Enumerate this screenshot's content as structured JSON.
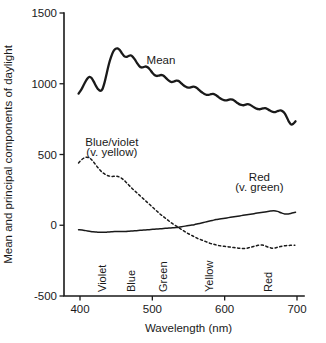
{
  "chart_data": {
    "type": "line",
    "title": "",
    "xlabel": "Wavelength (nm)",
    "ylabel": "Mean and principal components of daylight",
    "xlim": [
      390,
      702
    ],
    "ylim": [
      -500,
      1500
    ],
    "xticks": [
      400,
      500,
      600,
      700
    ],
    "xticklabels": [
      "400",
      "500",
      "600",
      "700"
    ],
    "yticks": [
      -500,
      0,
      500,
      1000,
      1500
    ],
    "yticklabels": [
      "-500",
      "0",
      "500",
      "1000",
      "1500"
    ],
    "grid": false,
    "legend_position": "inline-annotations",
    "band_labels": [
      {
        "text": "Violet",
        "wavelength": 430
      },
      {
        "text": "Blue",
        "wavelength": 470
      },
      {
        "text": "Green",
        "wavelength": 515
      },
      {
        "text": "Yellow",
        "wavelength": 578
      },
      {
        "text": "Red",
        "wavelength": 660
      }
    ],
    "annotations": [
      {
        "text": "Mean",
        "x": 512,
        "y": 1140
      },
      {
        "text": "Blue/violet",
        "x": 444,
        "y": 560
      },
      {
        "text": "(v. yellow)",
        "x": 444,
        "y": 490
      },
      {
        "text": "Red",
        "x": 648,
        "y": 310
      },
      {
        "text": "(v. green)",
        "x": 648,
        "y": 240
      }
    ],
    "series": [
      {
        "name": "Mean",
        "style": "solid",
        "label": "Mean",
        "x": [
          398,
          402,
          406,
          410,
          413,
          416,
          419,
          422,
          425,
          428,
          431,
          434,
          437,
          440,
          443,
          446,
          449,
          452,
          455,
          458,
          461,
          464,
          467,
          470,
          473,
          476,
          479,
          482,
          485,
          488,
          491,
          494,
          497,
          500,
          503,
          506,
          509,
          512,
          515,
          518,
          521,
          524,
          527,
          530,
          533,
          536,
          539,
          542,
          545,
          548,
          551,
          554,
          557,
          560,
          563,
          566,
          569,
          572,
          575,
          578,
          581,
          584,
          587,
          590,
          593,
          596,
          599,
          602,
          605,
          608,
          611,
          614,
          617,
          620,
          623,
          626,
          629,
          632,
          635,
          638,
          641,
          644,
          647,
          650,
          653,
          656,
          659,
          662,
          665,
          668,
          671,
          674,
          677,
          680,
          683,
          686,
          689,
          692,
          695,
          698
        ],
        "y": [
          930,
          960,
          1000,
          1035,
          1048,
          1040,
          1015,
          985,
          962,
          950,
          962,
          1010,
          1075,
          1140,
          1190,
          1228,
          1246,
          1250,
          1238,
          1215,
          1196,
          1190,
          1196,
          1200,
          1190,
          1170,
          1145,
          1125,
          1115,
          1118,
          1122,
          1115,
          1098,
          1078,
          1062,
          1055,
          1058,
          1062,
          1058,
          1045,
          1030,
          1018,
          1012,
          1016,
          1022,
          1020,
          1008,
          994,
          982,
          975,
          972,
          976,
          980,
          976,
          964,
          950,
          938,
          928,
          922,
          922,
          926,
          928,
          922,
          912,
          900,
          890,
          884,
          882,
          886,
          890,
          888,
          878,
          866,
          856,
          850,
          848,
          852,
          856,
          852,
          842,
          832,
          824,
          820,
          822,
          826,
          828,
          822,
          812,
          804,
          800,
          802,
          808,
          812,
          806,
          790,
          762,
          730,
          712,
          718,
          735
        ]
      },
      {
        "name": "Blue/violet (v. yellow)",
        "style": "dashed",
        "label": "Blue/violet",
        "sublabel": "(v. yellow)",
        "x": [
          398,
          402,
          406,
          409,
          412,
          415,
          418,
          421,
          424,
          427,
          430,
          433,
          436,
          439,
          442,
          445,
          448,
          451,
          454,
          457,
          460,
          463,
          466,
          469,
          472,
          475,
          478,
          481,
          484,
          487,
          490,
          493,
          496,
          499,
          502,
          505,
          508,
          511,
          514,
          517,
          520,
          523,
          526,
          529,
          532,
          535,
          538,
          541,
          544,
          547,
          550,
          553,
          556,
          559,
          562,
          565,
          568,
          571,
          574,
          577,
          580,
          583,
          586,
          589,
          592,
          595,
          598,
          601,
          604,
          607,
          610,
          613,
          616,
          619,
          622,
          625,
          628,
          631,
          634,
          637,
          640,
          643,
          646,
          649,
          652,
          655,
          658,
          661,
          664,
          667,
          670,
          673,
          676,
          679,
          682,
          685,
          688,
          691,
          694,
          697
        ],
        "y": [
          440,
          462,
          476,
          481,
          478,
          468,
          452,
          432,
          412,
          394,
          378,
          366,
          356,
          350,
          346,
          345,
          346,
          346,
          342,
          334,
          322,
          308,
          292,
          276,
          260,
          246,
          232,
          218,
          204,
          190,
          176,
          162,
          148,
          134,
          120,
          106,
          92,
          78,
          66,
          54,
          42,
          30,
          18,
          8,
          -2,
          -12,
          -22,
          -32,
          -42,
          -52,
          -60,
          -68,
          -76,
          -84,
          -92,
          -98,
          -104,
          -110,
          -116,
          -122,
          -128,
          -132,
          -136,
          -140,
          -144,
          -146,
          -148,
          -150,
          -152,
          -154,
          -156,
          -158,
          -160,
          -162,
          -163,
          -164,
          -164,
          -162,
          -158,
          -154,
          -150,
          -146,
          -142,
          -140,
          -140,
          -144,
          -150,
          -156,
          -160,
          -162,
          -160,
          -156,
          -152,
          -148,
          -146,
          -144,
          -143,
          -142,
          -142,
          -142
        ]
      },
      {
        "name": "Red (v. green)",
        "style": "solid",
        "label": "Red",
        "sublabel": "(v. green)",
        "x": [
          398,
          403,
          408,
          413,
          418,
          423,
          428,
          433,
          438,
          443,
          448,
          453,
          458,
          463,
          468,
          473,
          478,
          483,
          488,
          493,
          498,
          503,
          508,
          513,
          518,
          523,
          528,
          533,
          538,
          543,
          548,
          553,
          558,
          563,
          568,
          573,
          578,
          583,
          588,
          593,
          598,
          603,
          608,
          613,
          618,
          623,
          628,
          633,
          638,
          643,
          648,
          653,
          658,
          663,
          668,
          673,
          678,
          683,
          688,
          693,
          698
        ],
        "y": [
          -32,
          -34,
          -38,
          -42,
          -46,
          -48,
          -50,
          -50,
          -48,
          -46,
          -44,
          -44,
          -44,
          -44,
          -42,
          -40,
          -38,
          -36,
          -34,
          -32,
          -30,
          -28,
          -26,
          -24,
          -22,
          -20,
          -18,
          -16,
          -12,
          -8,
          -4,
          0,
          4,
          10,
          16,
          22,
          28,
          34,
          40,
          44,
          48,
          52,
          56,
          60,
          64,
          68,
          72,
          76,
          80,
          84,
          88,
          92,
          96,
          100,
          102,
          98,
          88,
          80,
          80,
          86,
          92
        ]
      }
    ]
  }
}
